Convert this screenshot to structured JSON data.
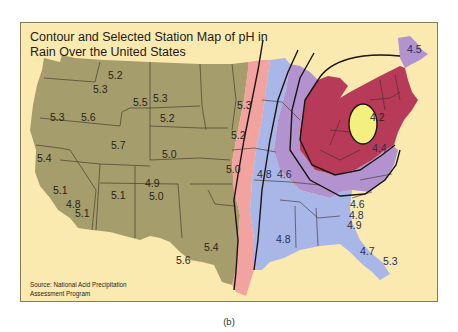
{
  "figure": {
    "title_line1": "Contour and Selected Station Map of pH in",
    "title_line2": "Rain Over the United States",
    "source_line1": "Source: National Acid Precipitation",
    "source_line2": "Assessment Program",
    "caption": "(b)"
  },
  "colors": {
    "background": "#fbeab0",
    "west_zone": "#a59e6c",
    "zone_5_0": "#f2a3a0",
    "zone_4_8": "#a8b6e8",
    "zone_4_6": "#b293cf",
    "zone_4_4": "#b73a58",
    "zone_4_2": "#f4f080",
    "state_lines": "#3a2e22",
    "contour_lines": "#1a1410"
  },
  "contour_levels": [
    "5.0",
    "4.8",
    "4.6",
    "4.4",
    "4.2"
  ],
  "station_labels": [
    {
      "value": "5.2",
      "x": 108,
      "y": 79
    },
    {
      "value": "5.3",
      "x": 93,
      "y": 93
    },
    {
      "value": "5.5",
      "x": 133,
      "y": 106
    },
    {
      "value": "5.3",
      "x": 153,
      "y": 102
    },
    {
      "value": "5.2",
      "x": 160,
      "y": 122
    },
    {
      "value": "5.3",
      "x": 237,
      "y": 109
    },
    {
      "value": "5.2",
      "x": 231,
      "y": 139
    },
    {
      "value": "5.3",
      "x": 50,
      "y": 121
    },
    {
      "value": "5.6",
      "x": 81,
      "y": 121
    },
    {
      "value": "5.7",
      "x": 111,
      "y": 149
    },
    {
      "value": "5.4",
      "x": 37,
      "y": 162
    },
    {
      "value": "5.0",
      "x": 162,
      "y": 158
    },
    {
      "value": "5.0",
      "x": 226,
      "y": 173
    },
    {
      "value": "4.8",
      "x": 257,
      "y": 178
    },
    {
      "value": "4.6",
      "x": 277,
      "y": 178
    },
    {
      "value": "5.1",
      "x": 53,
      "y": 194
    },
    {
      "value": "4.8",
      "x": 66,
      "y": 208
    },
    {
      "value": "5.1",
      "x": 75,
      "y": 217
    },
    {
      "value": "5.1",
      "x": 111,
      "y": 199
    },
    {
      "value": "4.9",
      "x": 145,
      "y": 187
    },
    {
      "value": "5.0",
      "x": 149,
      "y": 200
    },
    {
      "value": "5.4",
      "x": 204,
      "y": 251
    },
    {
      "value": "5.6",
      "x": 176,
      "y": 264
    },
    {
      "value": "4.5",
      "x": 407,
      "y": 53
    },
    {
      "value": "4.2",
      "x": 370,
      "y": 121
    },
    {
      "value": "4.4",
      "x": 372,
      "y": 152
    },
    {
      "value": "4.6",
      "x": 350,
      "y": 208
    },
    {
      "value": "4.8",
      "x": 349,
      "y": 219
    },
    {
      "value": "4.9",
      "x": 347,
      "y": 229
    },
    {
      "value": "4.8",
      "x": 276,
      "y": 243
    },
    {
      "value": "4.7",
      "x": 360,
      "y": 255
    },
    {
      "value": "5.3",
      "x": 383,
      "y": 265
    }
  ]
}
